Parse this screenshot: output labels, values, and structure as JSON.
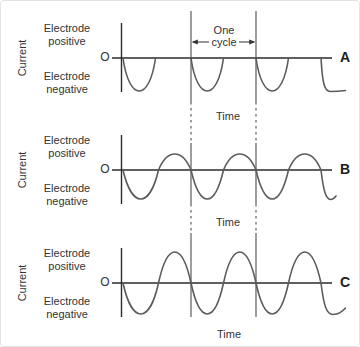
{
  "colors": {
    "axis": "#2b2b2b",
    "wave": "#5c5c5c",
    "cycle_marker": "#4d4d4d",
    "text": "#333333",
    "background": "#ffffff"
  },
  "annotation": {
    "line1": "One",
    "line2": "cycle"
  },
  "panels": [
    {
      "letter": "A",
      "ylabel": "Current",
      "origin": "O",
      "pos1": "Electrode",
      "pos2": "positive",
      "neg1": "Electrode",
      "neg2": "negative",
      "time": "Time",
      "wave": {
        "type": "negative-half-cycles-only",
        "positive_amplitude": 0,
        "negative_amplitude": 33
      }
    },
    {
      "letter": "B",
      "ylabel": "Current",
      "origin": "O",
      "pos1": "Electrode",
      "pos2": "positive",
      "neg1": "Electrode",
      "neg2": "negative",
      "time": "Time",
      "wave": {
        "type": "alternating-unbalanced",
        "positive_amplitude": 16,
        "negative_amplitude": 29
      }
    },
    {
      "letter": "C",
      "ylabel": "Current",
      "origin": "O",
      "pos1": "Electrode",
      "pos2": "positive",
      "neg1": "Electrode",
      "neg2": "negative",
      "time": "Time",
      "wave": {
        "type": "alternating-balanced",
        "positive_amplitude": 31,
        "negative_amplitude": 31
      }
    }
  ]
}
